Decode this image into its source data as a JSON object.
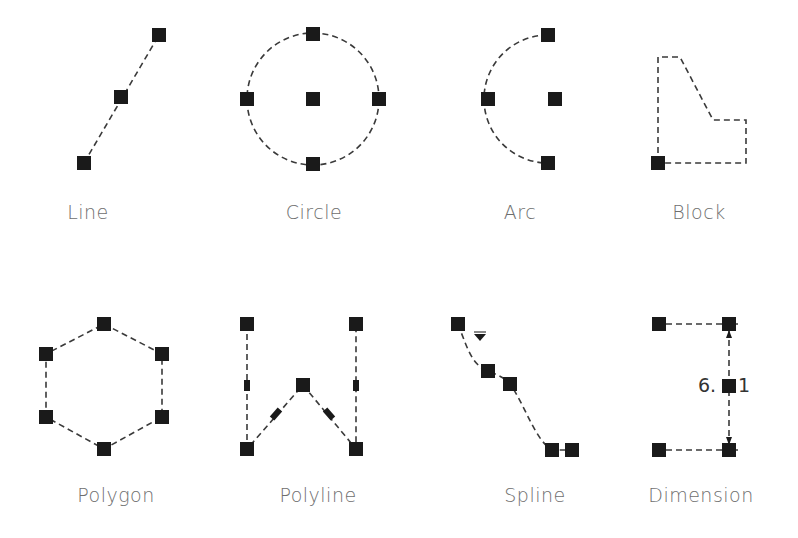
{
  "figure": {
    "colors": {
      "grip": "#1a1a1a",
      "line": "#3a3a3a",
      "label": "#6e6e6e"
    }
  },
  "objects": [
    {
      "id": "line",
      "label": "Line",
      "grips": 3
    },
    {
      "id": "circle",
      "label": "Circle",
      "grips": 5
    },
    {
      "id": "arc",
      "label": "Arc",
      "grips": 4
    },
    {
      "id": "block",
      "label": "Block",
      "grips": 1
    },
    {
      "id": "polygon",
      "label": "Polygon",
      "grips": 6
    },
    {
      "id": "polyline",
      "label": "Polyline",
      "grips": 5
    },
    {
      "id": "spline",
      "label": "Spline",
      "grips": 5
    },
    {
      "id": "dimension",
      "label": "Dimension",
      "grips": 5
    }
  ],
  "dimension": {
    "text_left": "6.",
    "text_right": "1"
  }
}
